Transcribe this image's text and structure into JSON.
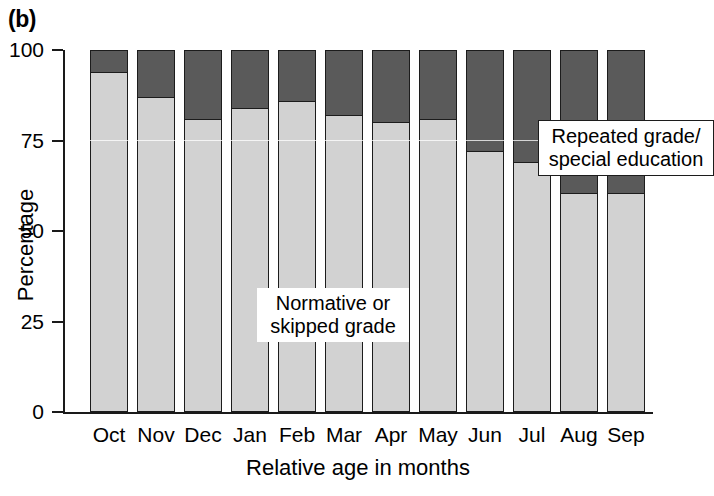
{
  "panel": {
    "label": "(b)"
  },
  "chart_data": {
    "type": "bar",
    "subtype": "stacked-100-percent",
    "title": "",
    "xlabel": "Relative age in months",
    "ylabel": "Percentage",
    "categories": [
      "Oct",
      "Nov",
      "Dec",
      "Jan",
      "Feb",
      "Mar",
      "Apr",
      "May",
      "Jun",
      "Jul",
      "Aug",
      "Sep"
    ],
    "series": [
      {
        "name": "Normative or skipped grade",
        "color": "#d2d2d2",
        "values": [
          94,
          87,
          81,
          84,
          86,
          82,
          80,
          81,
          72,
          69,
          60.5,
          60.5
        ]
      },
      {
        "name": "Repeated grade/special education",
        "color": "#5a5a5a",
        "values": [
          6,
          13,
          19,
          16,
          14,
          18,
          20,
          19,
          28,
          31,
          39.5,
          39.5
        ]
      }
    ],
    "ylim": [
      0,
      100
    ],
    "yticks": [
      0,
      25,
      50,
      75,
      100
    ],
    "ytick_labels": [
      "0",
      "25",
      "50",
      "75",
      "100"
    ],
    "grid": false,
    "legend_position": "in-plot-annotations"
  },
  "annotations": [
    {
      "id": "repeated",
      "line1": "Repeated grade/",
      "line2": "special education",
      "boxed": true
    },
    {
      "id": "normative",
      "line1": "Normative or",
      "line2": "skipped grade",
      "boxed": false
    }
  ],
  "colors": {
    "normative_fill": "#d2d2d2",
    "repeated_fill": "#5a5a5a",
    "stroke": "#1c1c1c",
    "background": "#ffffff"
  }
}
